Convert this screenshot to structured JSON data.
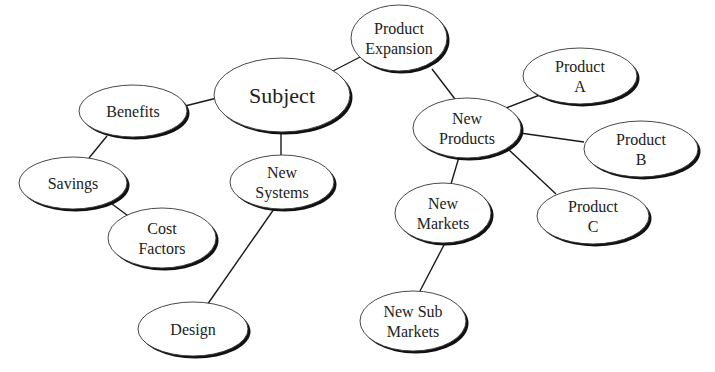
{
  "diagram": {
    "type": "mind-map",
    "colors": {
      "background": "#ffffff",
      "node_fill": "#ffffff",
      "node_stroke": "#333333",
      "node_shadow": "#111111",
      "edge": "#1a1a1a",
      "text": "#222222"
    },
    "nodes": [
      {
        "id": "subject",
        "lines": [
          "Subject"
        ],
        "cx": 282,
        "cy": 95,
        "rx": 68,
        "ry": 37,
        "big": true
      },
      {
        "id": "product-expansion",
        "lines": [
          "Product",
          "Expansion"
        ],
        "cx": 399,
        "cy": 38,
        "rx": 48,
        "ry": 33
      },
      {
        "id": "benefits",
        "lines": [
          "Benefits"
        ],
        "cx": 133,
        "cy": 111,
        "rx": 54,
        "ry": 26
      },
      {
        "id": "savings",
        "lines": [
          "Savings"
        ],
        "cx": 73,
        "cy": 183,
        "rx": 54,
        "ry": 26
      },
      {
        "id": "cost-factors",
        "lines": [
          "Cost",
          "Factors"
        ],
        "cx": 162,
        "cy": 238,
        "rx": 54,
        "ry": 30
      },
      {
        "id": "new-systems",
        "lines": [
          "New",
          "Systems"
        ],
        "cx": 282,
        "cy": 182,
        "rx": 52,
        "ry": 27
      },
      {
        "id": "design",
        "lines": [
          "Design"
        ],
        "cx": 193,
        "cy": 329,
        "rx": 55,
        "ry": 27
      },
      {
        "id": "new-products",
        "lines": [
          "New",
          "Products"
        ],
        "cx": 467,
        "cy": 128,
        "rx": 54,
        "ry": 30
      },
      {
        "id": "product-a",
        "lines": [
          "Product",
          "A"
        ],
        "cx": 580,
        "cy": 76,
        "rx": 57,
        "ry": 28
      },
      {
        "id": "product-b",
        "lines": [
          "Product",
          "B"
        ],
        "cx": 641,
        "cy": 149,
        "rx": 57,
        "ry": 28
      },
      {
        "id": "product-c",
        "lines": [
          "Product",
          "C"
        ],
        "cx": 593,
        "cy": 216,
        "rx": 56,
        "ry": 28
      },
      {
        "id": "new-markets",
        "lines": [
          "New",
          "Markets"
        ],
        "cx": 443,
        "cy": 213,
        "rx": 48,
        "ry": 30
      },
      {
        "id": "new-sub-markets",
        "lines": [
          "New Sub",
          "Markets"
        ],
        "cx": 413,
        "cy": 321,
        "rx": 53,
        "ry": 30
      }
    ],
    "edges": [
      {
        "from": "subject",
        "to": "benefits",
        "x1": 217,
        "y1": 98,
        "x2": 185,
        "y2": 106
      },
      {
        "from": "subject",
        "to": "product-expansion",
        "x1": 333,
        "y1": 71,
        "x2": 362,
        "y2": 56
      },
      {
        "from": "subject",
        "to": "new-systems",
        "x1": 281,
        "y1": 132,
        "x2": 281,
        "y2": 155
      },
      {
        "from": "benefits",
        "to": "savings",
        "x1": 107,
        "y1": 136,
        "x2": 89,
        "y2": 158
      },
      {
        "from": "savings",
        "to": "cost-factors",
        "x1": 112,
        "y1": 204,
        "x2": 131,
        "y2": 218
      },
      {
        "from": "new-systems",
        "to": "design",
        "x1": 274,
        "y1": 209,
        "x2": 207,
        "y2": 305
      },
      {
        "from": "product-expansion",
        "to": "new-products",
        "x1": 432,
        "y1": 69,
        "x2": 455,
        "y2": 99
      },
      {
        "from": "new-products",
        "to": "product-a",
        "x1": 506,
        "y1": 108,
        "x2": 545,
        "y2": 93
      },
      {
        "from": "new-products",
        "to": "product-b",
        "x1": 520,
        "y1": 133,
        "x2": 584,
        "y2": 142
      },
      {
        "from": "new-products",
        "to": "product-c",
        "x1": 507,
        "y1": 148,
        "x2": 556,
        "y2": 194
      },
      {
        "from": "new-products",
        "to": "new-markets",
        "x1": 459,
        "y1": 157,
        "x2": 451,
        "y2": 184
      },
      {
        "from": "new-markets",
        "to": "new-sub-markets",
        "x1": 445,
        "y1": 243,
        "x2": 420,
        "y2": 291
      }
    ]
  }
}
